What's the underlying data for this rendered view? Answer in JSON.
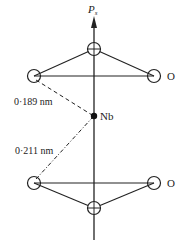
{
  "diagram": {
    "axis_label": "P",
    "axis_label_sub": "s",
    "atom_label_nb": "Nb",
    "atom_label_o_top": "O",
    "atom_label_o_bottom": "O",
    "bond_short": "0·189 nm",
    "bond_long": "0·211 nm",
    "colors": {
      "line": "#222222",
      "background": "#ffffff"
    }
  }
}
